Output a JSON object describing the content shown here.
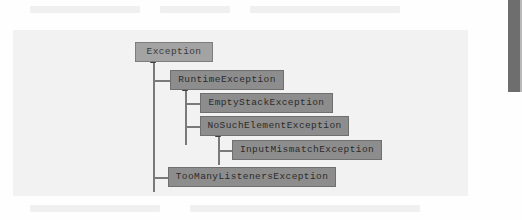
{
  "page": {
    "kind": "scanned-textbook-page",
    "background_color": "#fefefe",
    "panel_color": "#f2f2f2"
  },
  "diagram": {
    "type": "inheritance-hierarchy",
    "arrow_direction": "child-points-up-to-parent",
    "node_fill": "#8d8d8d",
    "root_fill": "#a3a3a3",
    "node_border": "#6f6f6f",
    "line_color": "#7a7a7a",
    "arrow_color": "#3c3c3c",
    "nodes": [
      {
        "id": "exception",
        "label": "Exception",
        "parent": null,
        "x": 135,
        "y": 42,
        "w": 78
      },
      {
        "id": "runtime-exception",
        "label": "RuntimeException",
        "parent": "exception",
        "x": 170,
        "y": 70,
        "w": 114
      },
      {
        "id": "empty-stack-exception",
        "label": "EmptyStackException",
        "parent": "runtime-exception",
        "x": 200,
        "y": 93,
        "w": 133
      },
      {
        "id": "no-such-element-exception",
        "label": "NoSuchElementException",
        "parent": "runtime-exception",
        "x": 200,
        "y": 116,
        "w": 149
      },
      {
        "id": "input-mismatch-exception",
        "label": "InputMismatchException",
        "parent": "no-such-element-exception",
        "x": 232,
        "y": 140,
        "w": 150
      },
      {
        "id": "too-many-listeners-exception",
        "label": "TooManyListenersException",
        "parent": "exception",
        "x": 168,
        "y": 167,
        "w": 168
      }
    ],
    "trunks": [
      {
        "id": "trunk-exception",
        "x": 153,
        "top": 57,
        "height": 135
      },
      {
        "id": "trunk-runtime",
        "x": 185,
        "top": 85,
        "height": 60
      },
      {
        "id": "trunk-no-such-element",
        "x": 218,
        "top": 131,
        "height": 34
      }
    ],
    "branches": [
      {
        "id": "branch-runtime",
        "x": 153,
        "y": 80,
        "width": 18
      },
      {
        "id": "branch-empty-stack",
        "x": 185,
        "y": 103,
        "width": 16
      },
      {
        "id": "branch-no-such-element",
        "x": 185,
        "y": 126,
        "width": 16
      },
      {
        "id": "branch-input-mismatch",
        "x": 218,
        "y": 150,
        "width": 15
      },
      {
        "id": "branch-too-many-listeners",
        "x": 153,
        "y": 177,
        "width": 16
      }
    ],
    "arrowheads": [
      {
        "id": "arrow-to-exception",
        "x": 150,
        "y": 56
      },
      {
        "id": "arrow-to-runtime",
        "x": 182,
        "y": 84
      },
      {
        "id": "arrow-to-no-such-element",
        "x": 215,
        "y": 130
      }
    ]
  },
  "ghost_text_lines": [
    {
      "x": 30,
      "y": 6,
      "w": 110
    },
    {
      "x": 160,
      "y": 6,
      "w": 70
    },
    {
      "x": 250,
      "y": 6,
      "w": 150
    },
    {
      "x": 30,
      "y": 38,
      "w": 95
    },
    {
      "x": 150,
      "y": 38,
      "w": 60
    },
    {
      "x": 230,
      "y": 38,
      "w": 185
    },
    {
      "x": 30,
      "y": 53,
      "w": 90
    },
    {
      "x": 230,
      "y": 53,
      "w": 190
    },
    {
      "x": 30,
      "y": 68,
      "w": 100
    },
    {
      "x": 295,
      "y": 68,
      "w": 125
    },
    {
      "x": 30,
      "y": 83,
      "w": 105
    },
    {
      "x": 340,
      "y": 83,
      "w": 80
    },
    {
      "x": 30,
      "y": 98,
      "w": 95
    },
    {
      "x": 345,
      "y": 98,
      "w": 75
    },
    {
      "x": 30,
      "y": 113,
      "w": 100
    },
    {
      "x": 360,
      "y": 113,
      "w": 60
    },
    {
      "x": 30,
      "y": 128,
      "w": 90
    },
    {
      "x": 390,
      "y": 128,
      "w": 30
    },
    {
      "x": 30,
      "y": 143,
      "w": 100
    },
    {
      "x": 30,
      "y": 158,
      "w": 85
    },
    {
      "x": 30,
      "y": 173,
      "w": 95
    },
    {
      "x": 345,
      "y": 173,
      "w": 75
    },
    {
      "x": 30,
      "y": 205,
      "w": 130
    },
    {
      "x": 190,
      "y": 205,
      "w": 230
    }
  ]
}
